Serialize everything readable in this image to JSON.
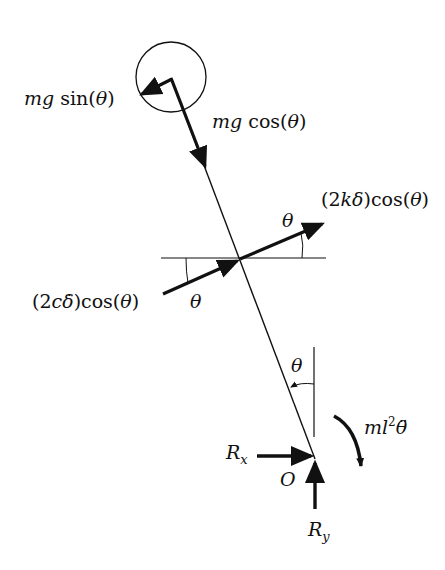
{
  "diagram": {
    "type": "free-body-diagram",
    "colors": {
      "stroke": "#111111",
      "background": "#ffffff"
    },
    "labels": {
      "mg_sin": {
        "mg": "mg",
        "fn": "sin(",
        "var": "θ",
        "close": ")"
      },
      "mg_cos": {
        "mg": "mg",
        "fn": "cos(",
        "var": "θ",
        "close": ")"
      },
      "spring_force": {
        "open": "(2",
        "k": "k",
        "delta": "δ",
        "close": ")cos(",
        "var": "θ",
        "end": ")"
      },
      "damper_force": {
        "open": "(2",
        "c": "c",
        "delta": "δ̇",
        "close": ")cos(",
        "var": "θ",
        "end": ")"
      },
      "theta_upper_right": "θ",
      "theta_lower_left": "θ",
      "theta_vertical": "θ",
      "moment": {
        "ml": "ml",
        "exp": "2",
        "var": "θ̈"
      },
      "rx": {
        "R": "R",
        "sub": "x"
      },
      "ry": {
        "R": "R",
        "sub": "y"
      },
      "origin": "O"
    }
  }
}
